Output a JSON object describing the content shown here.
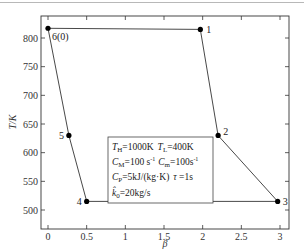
{
  "chart_data": {
    "type": "line",
    "title": "",
    "xlabel": "β",
    "ylabel": "T/K",
    "xlim": [
      -0.1,
      3.15
    ],
    "ylim": [
      490,
      835
    ],
    "xticks": [
      0,
      0.5,
      1,
      1.5,
      2,
      2.5,
      3
    ],
    "xtick_labels": [
      "0",
      "0.5",
      "1",
      "1.5",
      "2",
      "2.5",
      "3"
    ],
    "yticks": [
      500,
      550,
      600,
      650,
      700,
      750,
      800
    ],
    "ytick_labels": [
      "500",
      "550",
      "600",
      "650",
      "700",
      "750",
      "800"
    ],
    "grid": false,
    "series": [
      {
        "name": "cycle",
        "closed": true,
        "points": [
          {
            "label": "6(0)",
            "x": 0.0,
            "y": 817
          },
          {
            "label": "1",
            "x": 1.97,
            "y": 815
          },
          {
            "label": "2",
            "x": 2.2,
            "y": 630
          },
          {
            "label": "3",
            "x": 2.97,
            "y": 515
          },
          {
            "label": "4",
            "x": 0.5,
            "y": 515
          },
          {
            "label": "5",
            "x": 0.27,
            "y": 630
          }
        ]
      }
    ],
    "annotations": {
      "legend_box": [
        "T_H=1000K  T_L=400K",
        "C_M=100 s^-1  C_m=100s^-1",
        "C_P=5kJ/(kg·K)  τ=1s",
        "k̂_0=20kg/s"
      ]
    }
  },
  "legend": {
    "line1": {
      "a_sym": "T",
      "a_sub": "H",
      "a_val": "=1000K",
      "b_sym": "T",
      "b_sub": "L",
      "b_val": "=400K"
    },
    "line2": {
      "a_sym": "C",
      "a_sub": "M",
      "a_val": "=100 s",
      "a_sup": "-1",
      "b_sym": "C",
      "b_sub": "m",
      "b_val": "=100s",
      "b_sup": "-1"
    },
    "line3": {
      "a_sym": "C",
      "a_sub": "P",
      "a_val": "=5kJ/(kg·K)",
      "b_sym": "τ",
      "b_val": " =1s"
    },
    "line4": {
      "a_sym": "k̂",
      "a_sub": "0",
      "a_val": "=20kg/s"
    }
  }
}
